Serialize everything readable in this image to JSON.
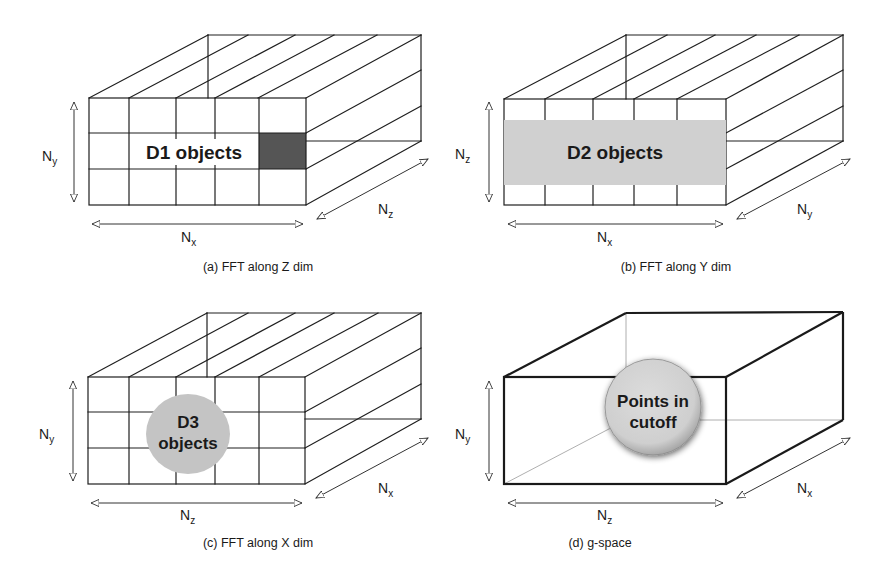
{
  "figure": {
    "panels": [
      {
        "id": "a",
        "caption": "(a) FFT along Z dim",
        "label_horizontal": {
          "main": "N",
          "sub": "x"
        },
        "label_vertical": {
          "main": "N",
          "sub": "y"
        },
        "label_depth": {
          "main": "N",
          "sub": "z"
        },
        "object_label": "D1 objects",
        "highlight": "dark-cell"
      },
      {
        "id": "b",
        "caption": "(b) FFT along Y dim",
        "label_horizontal": {
          "main": "N",
          "sub": "x"
        },
        "label_vertical": {
          "main": "N",
          "sub": "z"
        },
        "label_depth": {
          "main": "N",
          "sub": "y"
        },
        "object_label": "D2 objects",
        "highlight": "gray-band"
      },
      {
        "id": "c",
        "caption": "(c) FFT along X dim",
        "label_horizontal": {
          "main": "N",
          "sub": "z"
        },
        "label_vertical": {
          "main": "N",
          "sub": "y"
        },
        "label_depth": {
          "main": "N",
          "sub": "x"
        },
        "object_label_line1": "D3",
        "object_label_line2": "objects",
        "highlight": "gray-circle"
      },
      {
        "id": "d",
        "caption": "(d) g-space",
        "label_horizontal": {
          "main": "N",
          "sub": "z"
        },
        "label_vertical": {
          "main": "N",
          "sub": "y"
        },
        "label_depth": {
          "main": "N",
          "sub": "x"
        },
        "object_label_line1": "Points in",
        "object_label_line2": "cutoff",
        "highlight": "shaded-sphere"
      }
    ],
    "colors": {
      "line": "#1e1e1e",
      "dark_cell": "#555555",
      "gray_band": "#d0d0d0",
      "circle_fill": "#c4c4c4",
      "sphere_fill": "#d2d2d2"
    }
  }
}
